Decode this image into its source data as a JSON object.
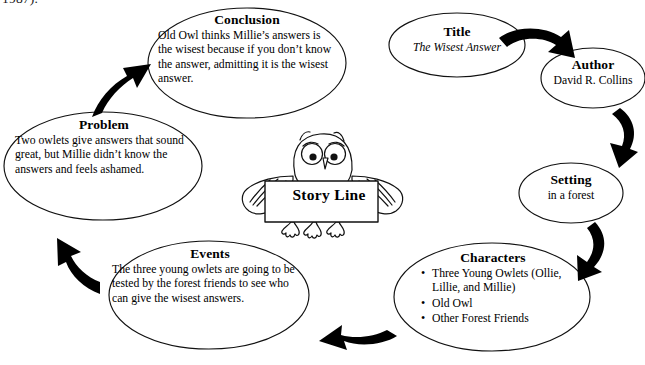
{
  "page_fragment": "1987).",
  "center": {
    "label": "Story Line",
    "icon": "owl-with-sign"
  },
  "nodes": [
    {
      "id": "conclusion",
      "title": "Conclusion",
      "body": "Old Owl thinks Millie’s answers is the wisest because if you don’t know the answer, admitting it is the wisest answer."
    },
    {
      "id": "title",
      "title": "Title",
      "body": "The Wisest Answer"
    },
    {
      "id": "author",
      "title": "Author",
      "body": "David R. Collins"
    },
    {
      "id": "setting",
      "title": "Setting",
      "body": "in a forest"
    },
    {
      "id": "characters",
      "title": "Characters",
      "bullets": [
        "Three Young Owlets (Ollie, Lillie, and Millie)",
        "Old Owl",
        "Other Forest Friends"
      ]
    },
    {
      "id": "events",
      "title": "Events",
      "body": "The three young owlets are going to be tested by the forest friends to see who can give the wisest answers."
    },
    {
      "id": "problem",
      "title": "Problem",
      "body": "Two owlets give answers that sound great, but Millie didn’t know the answers and feels ashamed."
    }
  ],
  "arrows": [
    {
      "id": "title-to-author",
      "direction": "right-down"
    },
    {
      "id": "author-to-setting",
      "direction": "down"
    },
    {
      "id": "setting-to-characters",
      "direction": "down-left"
    },
    {
      "id": "characters-to-events",
      "direction": "left"
    },
    {
      "id": "events-to-problem",
      "direction": "up-left"
    },
    {
      "id": "problem-to-conclusion",
      "direction": "up-right"
    }
  ],
  "colors": {
    "ink": "#000000",
    "background": "#ffffff",
    "outline": "#111111"
  }
}
